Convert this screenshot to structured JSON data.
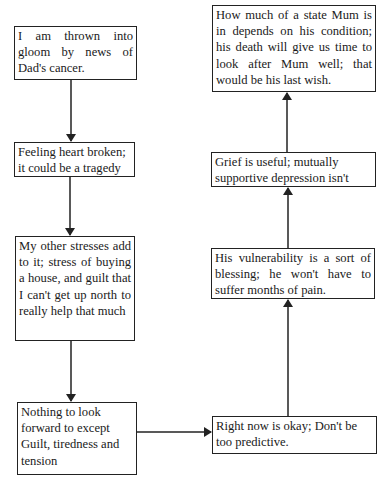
{
  "diagram": {
    "type": "flowchart",
    "nodes": [
      {
        "id": "n1",
        "text": "I am thrown into gloom by news of Dad's cancer."
      },
      {
        "id": "n2",
        "text": "Feeling heart broken; it could be a tragedy"
      },
      {
        "id": "n3",
        "text": "My other stresses add to it; stress of buying a house, and guilt that I can't get up north to really help that much"
      },
      {
        "id": "n4",
        "text": "Nothing to look forward to except Guilt, tiredness and tension"
      },
      {
        "id": "n5",
        "text": "Right now is okay; Don't be too predictive."
      },
      {
        "id": "n6",
        "text": "His vulnerability is a sort of blessing; he won't have to suffer months of pain."
      },
      {
        "id": "n7",
        "text": "Grief is useful; mutually supportive depression isn't"
      },
      {
        "id": "n8",
        "text": "How much of a state Mum is in depends on his condition; his death will give us time to look after Mum well; that would be his last wish."
      }
    ],
    "edges": [
      {
        "from": "n1",
        "to": "n2"
      },
      {
        "from": "n2",
        "to": "n3"
      },
      {
        "from": "n3",
        "to": "n4"
      },
      {
        "from": "n4",
        "to": "n5"
      },
      {
        "from": "n5",
        "to": "n6"
      },
      {
        "from": "n6",
        "to": "n7"
      },
      {
        "from": "n7",
        "to": "n8"
      }
    ],
    "colors": {
      "line": "#222222",
      "background": "#ffffff",
      "text": "#1a1a1a"
    }
  }
}
